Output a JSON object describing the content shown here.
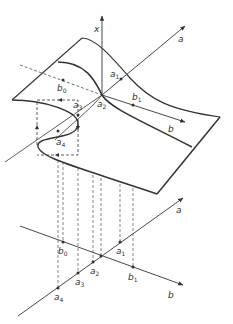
{
  "diagram": {
    "axes": {
      "x": "x",
      "a": "a",
      "b": "b"
    },
    "surface_labels": {
      "b0": {
        "base": "b",
        "sub": "0"
      },
      "a1": {
        "base": "a",
        "sub": "1"
      },
      "b1": {
        "base": "b",
        "sub": "1"
      },
      "a2": {
        "base": "a",
        "sub": "2"
      },
      "a3": {
        "base": "a",
        "sub": "3"
      },
      "a4": {
        "base": "a",
        "sub": "4"
      }
    },
    "plane_labels": {
      "b0": {
        "base": "b",
        "sub": "0"
      },
      "a1": {
        "base": "a",
        "sub": "1"
      },
      "a2": {
        "base": "a",
        "sub": "2"
      },
      "b1": {
        "base": "b",
        "sub": "1"
      },
      "a3": {
        "base": "a",
        "sub": "3"
      },
      "a4": {
        "base": "a",
        "sub": "4"
      },
      "a_axis": "a",
      "b_axis": "b"
    },
    "colors": {
      "line": "#333333",
      "background": "#ffffff"
    }
  }
}
